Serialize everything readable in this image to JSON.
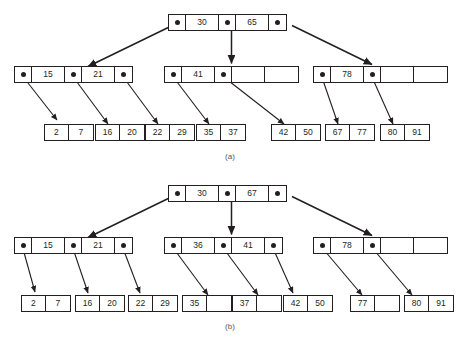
{
  "figure": {
    "panels": [
      {
        "id": "a",
        "caption": "(a)",
        "root": {
          "name": "root-node-a",
          "cells": [
            {
              "type": "pointer",
              "value": ""
            },
            {
              "type": "key",
              "value": "30"
            },
            {
              "type": "pointer",
              "value": ""
            },
            {
              "type": "key",
              "value": "65"
            },
            {
              "type": "pointer",
              "value": ""
            }
          ]
        },
        "internal": [
          {
            "name": "internal-node-a-left",
            "cells": [
              {
                "type": "pointer",
                "value": ""
              },
              {
                "type": "key",
                "value": "15"
              },
              {
                "type": "pointer",
                "value": ""
              },
              {
                "type": "key",
                "value": "21"
              },
              {
                "type": "pointer",
                "value": ""
              }
            ]
          },
          {
            "name": "internal-node-a-middle",
            "cells": [
              {
                "type": "pointer",
                "value": ""
              },
              {
                "type": "key",
                "value": "41"
              },
              {
                "type": "pointer",
                "value": ""
              },
              {
                "type": "blank",
                "value": ""
              },
              {
                "type": "blank",
                "value": ""
              }
            ]
          },
          {
            "name": "internal-node-a-right",
            "cells": [
              {
                "type": "pointer",
                "value": ""
              },
              {
                "type": "key",
                "value": "78"
              },
              {
                "type": "pointer",
                "value": ""
              },
              {
                "type": "blank",
                "value": ""
              },
              {
                "type": "blank",
                "value": ""
              }
            ]
          }
        ],
        "leaves": [
          {
            "name": "leaf-node-a-1",
            "keys": [
              "2",
              "7"
            ]
          },
          {
            "name": "leaf-node-a-2",
            "keys": [
              "16",
              "20"
            ]
          },
          {
            "name": "leaf-node-a-3",
            "keys": [
              "22",
              "29"
            ]
          },
          {
            "name": "leaf-node-a-4",
            "keys": [
              "35",
              "37"
            ]
          },
          {
            "name": "leaf-node-a-5",
            "keys": [
              "42",
              "50"
            ]
          },
          {
            "name": "leaf-node-a-6",
            "keys": [
              "67",
              "77"
            ]
          },
          {
            "name": "leaf-node-a-7",
            "keys": [
              "80",
              "91"
            ]
          }
        ]
      },
      {
        "id": "b",
        "caption": "(b)",
        "root": {
          "name": "root-node-b",
          "cells": [
            {
              "type": "pointer",
              "value": ""
            },
            {
              "type": "key",
              "value": "30"
            },
            {
              "type": "pointer",
              "value": ""
            },
            {
              "type": "key",
              "value": "67"
            },
            {
              "type": "pointer",
              "value": ""
            }
          ]
        },
        "internal": [
          {
            "name": "internal-node-b-left",
            "cells": [
              {
                "type": "pointer",
                "value": ""
              },
              {
                "type": "key",
                "value": "15"
              },
              {
                "type": "pointer",
                "value": ""
              },
              {
                "type": "key",
                "value": "21"
              },
              {
                "type": "pointer",
                "value": ""
              }
            ]
          },
          {
            "name": "internal-node-b-middle",
            "cells": [
              {
                "type": "pointer",
                "value": ""
              },
              {
                "type": "key",
                "value": "36"
              },
              {
                "type": "pointer",
                "value": ""
              },
              {
                "type": "key",
                "value": "41"
              },
              {
                "type": "pointer",
                "value": ""
              }
            ]
          },
          {
            "name": "internal-node-b-right",
            "cells": [
              {
                "type": "pointer",
                "value": ""
              },
              {
                "type": "key",
                "value": "78"
              },
              {
                "type": "pointer",
                "value": ""
              },
              {
                "type": "blank",
                "value": ""
              },
              {
                "type": "blank",
                "value": ""
              }
            ]
          }
        ],
        "leaves": [
          {
            "name": "leaf-node-b-1",
            "keys": [
              "2",
              "7"
            ]
          },
          {
            "name": "leaf-node-b-2",
            "keys": [
              "16",
              "20"
            ]
          },
          {
            "name": "leaf-node-b-3",
            "keys": [
              "22",
              "29"
            ]
          },
          {
            "name": "leaf-node-b-4",
            "keys": [
              "35",
              ""
            ]
          },
          {
            "name": "leaf-node-b-5",
            "keys": [
              "37",
              ""
            ]
          },
          {
            "name": "leaf-node-b-6",
            "keys": [
              "42",
              "50"
            ]
          },
          {
            "name": "leaf-node-b-7",
            "keys": [
              "77",
              ""
            ]
          },
          {
            "name": "leaf-node-b-8",
            "keys": [
              "80",
              "91"
            ]
          }
        ]
      }
    ],
    "colors": {
      "stroke": "#231f20",
      "background": "#ffffff",
      "caption": "#58595b"
    }
  }
}
